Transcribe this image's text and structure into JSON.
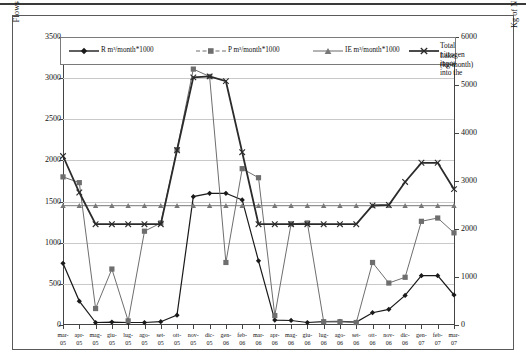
{
  "chart_data": {
    "type": "line",
    "title": "",
    "xlabel": "",
    "ylabel": "Flows towards the Lake (m³*1000)",
    "y2label": "Kg of N carried into the Lake by surface water and groundwater",
    "ylim": [
      0,
      3500
    ],
    "y2lim": [
      0,
      6000
    ],
    "yticks": [
      0,
      500,
      1000,
      1500,
      2000,
      2500,
      3000,
      3500
    ],
    "y2ticks": [
      0,
      1000,
      2000,
      3000,
      4000,
      5000,
      6000
    ],
    "grid": true,
    "legend_position": "top-inside",
    "categories": [
      "mar-05",
      "apr-05",
      "mag-05",
      "giu-05",
      "lug-05",
      "ago-05",
      "set-05",
      "ott-05",
      "nov-05",
      "dic-05",
      "gen-06",
      "feb-06",
      "mar-06",
      "apr-06",
      "mag-06",
      "giu-06",
      "lug-06",
      "ago-06",
      "set-06",
      "ott-06",
      "nov-06",
      "dic-06",
      "gen-07",
      "feb-07",
      "mar-07"
    ],
    "series": [
      {
        "name": "R  m³/month*1000",
        "key": "R",
        "axis": "left",
        "marker": "diamond",
        "color": "#1a1a1a",
        "values": [
          750,
          290,
          30,
          35,
          30,
          30,
          40,
          120,
          1560,
          1600,
          1600,
          1520,
          780,
          60,
          55,
          30,
          40,
          45,
          35,
          150,
          190,
          360,
          600,
          600,
          365
        ]
      },
      {
        "name": "P  m³/month*1000",
        "key": "P",
        "axis": "left",
        "marker": "square",
        "color": "#6e6e6e",
        "values": [
          1800,
          1730,
          200,
          680,
          50,
          1140,
          1240,
          2130,
          3110,
          3020,
          760,
          1900,
          1790,
          115,
          1230,
          1240,
          40,
          40,
          30,
          760,
          510,
          580,
          1260,
          1300,
          1120
        ]
      },
      {
        "name": "IE  m³/month*1000",
        "key": "IE",
        "axis": "left",
        "marker": "triangle",
        "color": "#777777",
        "values": [
          1450,
          1450,
          1450,
          1450,
          1450,
          1450,
          1450,
          1450,
          1450,
          1450,
          1450,
          1450,
          1450,
          1450,
          1450,
          1450,
          1450,
          1450,
          1450,
          1450,
          1450,
          1450,
          1450,
          1450,
          1450
        ]
      },
      {
        "name": "Total nitrogen input into the Lake (kg/month)",
        "key": "N",
        "axis": "right",
        "marker": "cross",
        "color": "#2b2b2b",
        "values": [
          3520,
          2760,
          2100,
          2100,
          2100,
          2100,
          2100,
          3640,
          5160,
          5180,
          5080,
          3600,
          2100,
          2100,
          2100,
          2100,
          2100,
          2100,
          2100,
          2490,
          2500,
          2980,
          3380,
          3380,
          2830
        ]
      }
    ]
  },
  "legend": {
    "items": [
      {
        "label": "R  m³/month*1000",
        "marker": "diamond"
      },
      {
        "label": "P  m³/month*1000",
        "marker": "square"
      },
      {
        "label": "IE  m³/month*1000",
        "marker": "triangle"
      },
      {
        "label_line1": "Total nitrogen input into the",
        "label_line2": "Lake (kg/month)",
        "marker": "cross"
      }
    ]
  },
  "axes": {
    "left_title": "Flows towards the Lake (m³*1000)",
    "right_title": "Kg of N carried into the Lake by surface water and groundwater"
  }
}
